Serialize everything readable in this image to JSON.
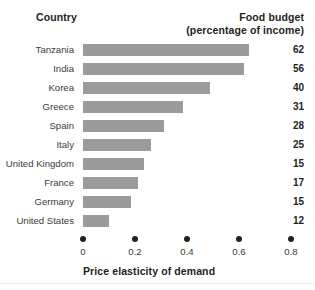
{
  "header": {
    "country_label": "Country",
    "right_line1": "Food budget",
    "right_line2": "(percentage of income)"
  },
  "axis": {
    "title": "Price elasticity of demand",
    "ticks": [
      "0",
      "0.2",
      "0.4",
      "0.6",
      "0.8"
    ]
  },
  "colors": {
    "bar": "#9b9b9b",
    "text": "#231f20",
    "label_text": "#3b3b3b",
    "background": "#ffffff"
  },
  "chart_data": {
    "type": "bar",
    "orientation": "horizontal",
    "title": "",
    "xlabel": "Price elasticity of demand",
    "ylabel": "Country",
    "xlim": [
      0,
      0.8654
    ],
    "grid": false,
    "legend": null,
    "tick_values": [
      0,
      0.2,
      0.4,
      0.6,
      0.8
    ],
    "tick_labels": [
      "0",
      "0.2",
      "0.4",
      "0.6",
      "0.8"
    ],
    "categories": [
      "Tanzania",
      "India",
      "Korea",
      "Greece",
      "Spain",
      "Italy",
      "United Kingdom",
      "France",
      "Germany",
      "United States"
    ],
    "values": [
      0.64,
      0.62,
      0.49,
      0.385,
      0.31,
      0.26,
      0.235,
      0.21,
      0.185,
      0.1
    ],
    "annotations": {
      "column_header": "Food budget (percentage of income)",
      "column_values": [
        62,
        56,
        40,
        31,
        28,
        25,
        15,
        17,
        15,
        12
      ]
    },
    "rows": [
      {
        "country": "Tanzania",
        "elasticity": 0.64,
        "food_budget": "62"
      },
      {
        "country": "India",
        "elasticity": 0.62,
        "food_budget": "56"
      },
      {
        "country": "Korea",
        "elasticity": 0.49,
        "food_budget": "40"
      },
      {
        "country": "Greece",
        "elasticity": 0.385,
        "food_budget": "31"
      },
      {
        "country": "Spain",
        "elasticity": 0.31,
        "food_budget": "28"
      },
      {
        "country": "Italy",
        "elasticity": 0.26,
        "food_budget": "25"
      },
      {
        "country": "United Kingdom",
        "elasticity": 0.235,
        "food_budget": "15"
      },
      {
        "country": "France",
        "elasticity": 0.21,
        "food_budget": "17"
      },
      {
        "country": "Germany",
        "elasticity": 0.185,
        "food_budget": "15"
      },
      {
        "country": "United States",
        "elasticity": 0.1,
        "food_budget": "12"
      }
    ]
  }
}
